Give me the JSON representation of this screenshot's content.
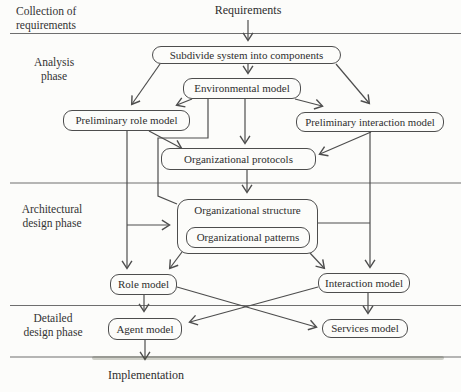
{
  "figure": {
    "type": "flowchart",
    "phases": [
      {
        "id": "collection",
        "lines": [
          "Collection of",
          "requirements"
        ]
      },
      {
        "id": "analysis",
        "lines": [
          "Analysis",
          "phase"
        ]
      },
      {
        "id": "architectural",
        "lines": [
          "Architectural",
          "design phase"
        ]
      },
      {
        "id": "detailed",
        "lines": [
          "Detailed",
          "design phase"
        ]
      }
    ],
    "nodes": {
      "requirements": "Requirements",
      "subdivide": "Subdivide system into components",
      "environmental": "Environmental model",
      "prelim_role": "Preliminary role model",
      "prelim_interaction": "Preliminary interaction model",
      "protocols": "Organizational protocols",
      "org_structure": "Organizational structure",
      "org_patterns": "Organizational patterns",
      "role_model": "Role model",
      "interaction_model": "Interaction model",
      "agent_model": "Agent model",
      "services_model": "Services model",
      "implementation": "Implementation"
    },
    "edges": [
      {
        "from": "requirements",
        "to": "subdivide"
      },
      {
        "from": "subdivide",
        "to": "environmental"
      },
      {
        "from": "subdivide",
        "to": "prelim_role"
      },
      {
        "from": "subdivide",
        "to": "prelim_interaction"
      },
      {
        "from": "environmental",
        "to": "prelim_role"
      },
      {
        "from": "environmental",
        "to": "prelim_interaction"
      },
      {
        "from": "environmental",
        "to": "protocols"
      },
      {
        "from": "environmental",
        "to": "org_structure"
      },
      {
        "from": "prelim_role",
        "to": "protocols"
      },
      {
        "from": "prelim_interaction",
        "to": "protocols"
      },
      {
        "from": "prelim_role",
        "to": "role_model"
      },
      {
        "from": "prelim_role",
        "to": "org_structure"
      },
      {
        "from": "prelim_interaction",
        "to": "interaction_model"
      },
      {
        "from": "protocols",
        "to": "org_structure"
      },
      {
        "from": "org_structure",
        "to": "role_model"
      },
      {
        "from": "org_structure",
        "to": "interaction_model"
      },
      {
        "from": "role_model",
        "to": "agent_model"
      },
      {
        "from": "role_model",
        "to": "services_model"
      },
      {
        "from": "interaction_model",
        "to": "agent_model"
      },
      {
        "from": "interaction_model",
        "to": "services_model"
      },
      {
        "from": "agent_model",
        "to": "implementation"
      }
    ],
    "colors": {
      "line": "#4d4d4d",
      "divider": "#6e6e6e",
      "text": "#2e2e2e",
      "background": "#fcfcfa"
    }
  }
}
